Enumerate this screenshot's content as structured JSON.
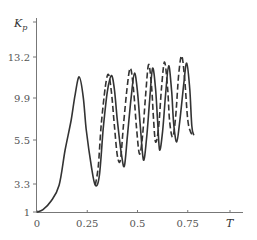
{
  "chart_data": {
    "type": "line",
    "title": "",
    "xlabel": "T",
    "ylabel": "K_p",
    "ylabel_main": "K",
    "ylabel_sub": "p",
    "xlim": [
      0,
      1.0
    ],
    "ylim": [
      1,
      14.5
    ],
    "grid": false,
    "legend": null,
    "x_ticks": [
      {
        "value": 0,
        "label": "0"
      },
      {
        "value": 0.25,
        "label": "0.25"
      },
      {
        "value": 0.5,
        "label": "0.5"
      },
      {
        "value": 0.75,
        "label": "0.75"
      }
    ],
    "y_ticks": [
      {
        "value": 1,
        "label": "1"
      },
      {
        "value": 3.3,
        "label": "3.3"
      },
      {
        "value": 5.5,
        "label": "5.5"
      },
      {
        "value": 9.9,
        "label": "9.9"
      },
      {
        "value": 13.2,
        "label": "13.2"
      }
    ],
    "series": [
      {
        "name": "solid",
        "style": "solid",
        "color": "#333333",
        "points": [
          [
            0.0,
            1.0
          ],
          [
            0.03,
            1.2
          ],
          [
            0.07,
            1.9
          ],
          [
            0.11,
            3.2
          ],
          [
            0.14,
            5.0
          ],
          [
            0.17,
            7.6
          ],
          [
            0.19,
            10.2
          ],
          [
            0.21,
            11.6
          ],
          [
            0.23,
            10.0
          ],
          [
            0.245,
            6.6
          ],
          [
            0.27,
            4.2
          ],
          [
            0.29,
            3.2
          ],
          [
            0.31,
            3.7
          ],
          [
            0.33,
            6.8
          ],
          [
            0.35,
            10.4
          ],
          [
            0.37,
            11.7
          ],
          [
            0.385,
            10.6
          ],
          [
            0.4,
            7.5
          ],
          [
            0.42,
            4.8
          ],
          [
            0.435,
            4.2
          ],
          [
            0.45,
            6.0
          ],
          [
            0.47,
            10.2
          ],
          [
            0.485,
            11.9
          ],
          [
            0.5,
            10.4
          ],
          [
            0.515,
            6.7
          ],
          [
            0.53,
            4.5
          ],
          [
            0.545,
            5.6
          ],
          [
            0.56,
            9.6
          ],
          [
            0.575,
            12.3
          ],
          [
            0.59,
            10.6
          ],
          [
            0.6,
            7.5
          ],
          [
            0.61,
            5.0
          ],
          [
            0.625,
            6.4
          ],
          [
            0.64,
            10.2
          ],
          [
            0.655,
            12.5
          ],
          [
            0.67,
            10.4
          ],
          [
            0.68,
            7.2
          ],
          [
            0.695,
            5.4
          ],
          [
            0.71,
            7.4
          ],
          [
            0.73,
            11.0
          ],
          [
            0.745,
            12.7
          ],
          [
            0.76,
            10.6
          ],
          [
            0.77,
            7.0
          ],
          [
            0.78,
            6.0
          ]
        ]
      },
      {
        "name": "dashed",
        "style": "dashed",
        "color": "#333333",
        "points": [
          [
            0.29,
            3.2
          ],
          [
            0.305,
            4.2
          ],
          [
            0.32,
            7.2
          ],
          [
            0.34,
            10.8
          ],
          [
            0.355,
            11.8
          ],
          [
            0.37,
            10.4
          ],
          [
            0.385,
            7.0
          ],
          [
            0.4,
            4.7
          ],
          [
            0.415,
            4.5
          ],
          [
            0.43,
            7.0
          ],
          [
            0.45,
            11.0
          ],
          [
            0.465,
            12.3
          ],
          [
            0.48,
            10.6
          ],
          [
            0.495,
            6.8
          ],
          [
            0.51,
            4.8
          ],
          [
            0.525,
            5.9
          ],
          [
            0.54,
            10.0
          ],
          [
            0.555,
            12.6
          ],
          [
            0.57,
            10.8
          ],
          [
            0.58,
            7.6
          ],
          [
            0.59,
            5.4
          ],
          [
            0.605,
            6.8
          ],
          [
            0.62,
            10.8
          ],
          [
            0.635,
            12.8
          ],
          [
            0.65,
            10.6
          ],
          [
            0.66,
            7.4
          ],
          [
            0.675,
            5.8
          ],
          [
            0.69,
            8.0
          ],
          [
            0.705,
            11.8
          ],
          [
            0.72,
            13.3
          ],
          [
            0.735,
            11.4
          ],
          [
            0.75,
            7.6
          ],
          [
            0.765,
            6.3
          ],
          [
            0.78,
            6.0
          ]
        ]
      }
    ]
  }
}
